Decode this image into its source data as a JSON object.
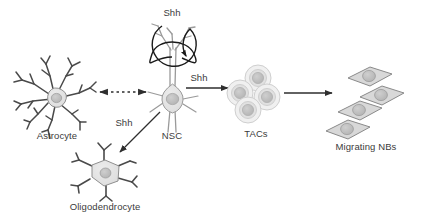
{
  "diagram": {
    "background_color": "#ffffff",
    "stroke_color": "#3b3b3b",
    "cell_fill": "#e2e2e2",
    "nucleus_fill": "#bdbdbd",
    "text_color": "#3b3b3b",
    "cells": [
      {
        "id": "astrocyte",
        "label": "Astrocyte",
        "shape": "star-branched"
      },
      {
        "id": "nsc",
        "label": "NSC",
        "shape": "radial-glia-spindle"
      },
      {
        "id": "oligodendrocyte",
        "label": "Oligodendrocyte",
        "shape": "pentagonal-branched"
      },
      {
        "id": "tacs",
        "label": "TACs",
        "shape": "round-cluster",
        "count": 4
      },
      {
        "id": "migrating-nbs",
        "label": "Migrating NBs",
        "shape": "diamond-chain",
        "count": 4
      }
    ],
    "signals": [
      {
        "id": "shh-autocrine",
        "label": "Shh",
        "from": "nsc",
        "to": "nsc",
        "arrow": "self-loop"
      },
      {
        "id": "shh-to-tacs",
        "label": "Shh",
        "from": "nsc",
        "to": "tacs",
        "arrow": "solid-right"
      },
      {
        "id": "shh-to-oligodendrocyte",
        "label": "Shh",
        "from": "nsc",
        "to": "oligodendrocyte",
        "arrow": "solid-diagonal"
      }
    ],
    "connections": [
      {
        "id": "astrocyte-nsc",
        "from": "astrocyte",
        "to": "nsc",
        "arrow": "dotted-bidirectional"
      },
      {
        "id": "tacs-nbs",
        "from": "tacs",
        "to": "migrating-nbs",
        "arrow": "solid-right"
      }
    ]
  }
}
